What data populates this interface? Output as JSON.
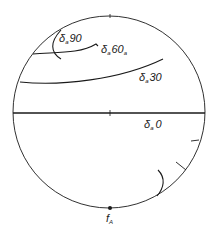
{
  "diagram": {
    "type": "circle-projection",
    "circle": {
      "cx": 109,
      "cy": 112,
      "r": 96
    },
    "stroke_color": "#1a1a1a",
    "labels": [
      {
        "id": "delta90",
        "symbol": "δ",
        "subscript": "a",
        "value": "90",
        "x": 58,
        "y": 41
      },
      {
        "id": "delta60",
        "symbol": "δ",
        "subscript": "a",
        "value": "60",
        "trail_subscript": "a",
        "x": 100,
        "y": 53
      },
      {
        "id": "delta30",
        "symbol": "δ",
        "subscript": "a",
        "value": "30",
        "x": 138,
        "y": 81
      },
      {
        "id": "delta0",
        "symbol": "δ",
        "subscript": "a",
        "value": "0",
        "x": 143,
        "y": 128
      }
    ],
    "pole_label": {
      "symbol": "f",
      "subscript": "A"
    }
  }
}
